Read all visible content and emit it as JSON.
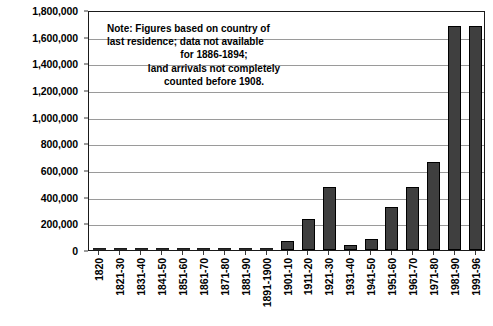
{
  "chart_data": {
    "type": "bar",
    "title": "",
    "xlabel": "",
    "ylabel": "",
    "ylim": [
      0,
      1800000
    ],
    "grid": true,
    "legend": "none",
    "y_ticks": [
      "0",
      "200,000",
      "400,000",
      "600,000",
      "800,000",
      "1,000,000",
      "1,200,000",
      "1,400,000",
      "1,600,000",
      "1,800,000"
    ],
    "y_tick_values": [
      0,
      200000,
      400000,
      600000,
      800000,
      1000000,
      1200000,
      1400000,
      1600000,
      1800000
    ],
    "categories": [
      "1820",
      "1821-30",
      "1831-40",
      "1841-50",
      "1851-60",
      "1861-70",
      "1871-80",
      "1881-90",
      "1891-1900",
      "1901-10",
      "1911-20",
      "1921-30",
      "1931-40",
      "1941-50",
      "1951-60",
      "1961-70",
      "1971-80",
      "1981-90",
      "1991-96"
    ],
    "values": [
      0,
      0,
      0,
      0,
      0,
      0,
      0,
      0,
      0,
      65000,
      230000,
      470000,
      35000,
      85000,
      320000,
      470000,
      660000,
      1680000,
      1680000
    ],
    "annotations": {
      "note_lines": [
        "Note: Figures based on country of",
        "last residence; data not available",
        "for 1886-1894;",
        "land arrivals not completely",
        "counted before 1908."
      ]
    },
    "colors": {
      "bar_fill": "#3f3f3f",
      "bar_outline": "#000000",
      "gridline": "#9a9a9a",
      "frame": "#1a1a1a",
      "background": "#ffffff",
      "text": "#000000"
    }
  }
}
